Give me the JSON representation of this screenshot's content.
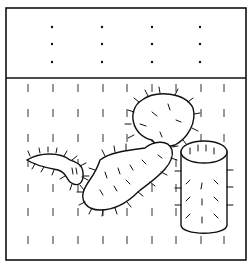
{
  "figure": {
    "colors": {
      "ink": "#111111",
      "background": "#ffffff"
    },
    "frame": {
      "x": 6,
      "y": 8,
      "width": 240,
      "height": 252,
      "divider_y": 78
    },
    "top_panel": {
      "dot_columns_x": [
        52,
        102,
        152,
        200
      ],
      "dot_rows_y": [
        27,
        44,
        62
      ]
    },
    "bottom_panel": {
      "dash_columns_x": [
        28,
        53,
        78,
        103,
        127,
        152,
        176,
        201,
        224
      ],
      "dash_rows_y": [
        88,
        113,
        138,
        163,
        188,
        212,
        240
      ]
    },
    "objects": [
      {
        "name": "pad-cactus",
        "label": "branching spiny pad cactus"
      },
      {
        "name": "cylinder-cactus",
        "label": "cylindrical spiny cactus"
      }
    ]
  }
}
